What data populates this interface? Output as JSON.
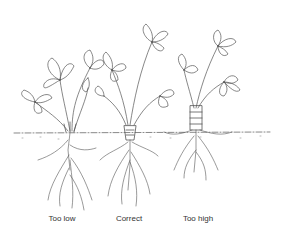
{
  "figure": {
    "panels": [
      {
        "id": "too-low",
        "label": "Too low",
        "depth": "crown buried below soil"
      },
      {
        "id": "correct",
        "label": "Correct",
        "depth": "crown at soil level"
      },
      {
        "id": "too-high",
        "label": "Too high",
        "depth": "crown and roots exposed above soil"
      }
    ]
  },
  "colors": {
    "ink": "#555555",
    "background": "#ffffff",
    "label": "#333333"
  }
}
